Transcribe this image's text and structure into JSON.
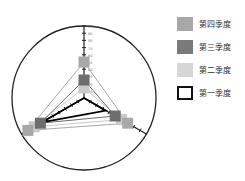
{
  "chart_data": {
    "type": "radar",
    "title": "",
    "axes": [
      "A",
      "B",
      "C"
    ],
    "axis_max": 100,
    "ticks": [
      10,
      20,
      30,
      40,
      50,
      60,
      70,
      80,
      90,
      100
    ],
    "series": [
      {
        "name": "第四季度",
        "color": "#a8a8a8",
        "values": [
          50,
          90,
          70
        ]
      },
      {
        "name": "第三季度",
        "color": "#6e6e6e",
        "values": [
          25,
          70,
          50
        ]
      },
      {
        "name": "第二季度",
        "color": "#c9c9c9",
        "values": [
          14,
          80,
          60
        ]
      },
      {
        "name": "第一季度",
        "color": "#000000",
        "values": [
          0,
          68,
          35
        ]
      }
    ],
    "legend_position": "right"
  },
  "legend": {
    "items": [
      {
        "label": "第四季度",
        "color": "#a8a8a8",
        "style": "fill"
      },
      {
        "label": "第三季度",
        "color": "#6e6e6e",
        "style": "fill"
      },
      {
        "label": "第二季度",
        "color": "#d6d6d6",
        "style": "fill"
      },
      {
        "label": "第一季度",
        "color": "#000000",
        "style": "outline"
      }
    ]
  }
}
